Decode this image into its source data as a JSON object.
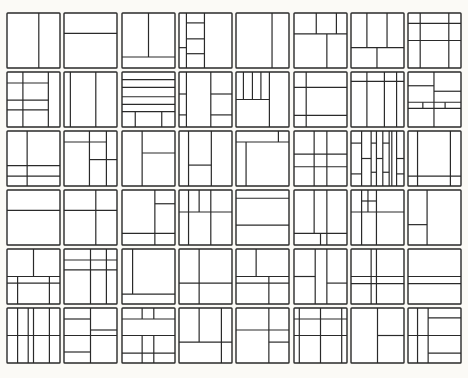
{
  "diagram": {
    "rows": 6,
    "cols": 8,
    "stroke_color": "#2a2a2a",
    "background": "#fbfaf6",
    "layout": {
      "origin_x": 7,
      "origin_y": 13,
      "cell_w": 53,
      "cell_h": 55,
      "pitch_x": 57.3,
      "pitch_y": 59.0
    },
    "cells": [
      [
        [
          [
            60,
            0,
            60,
            100
          ]
        ],
        [
          [
            0,
            37,
            100,
            37
          ]
        ],
        [
          [
            50,
            0,
            50,
            80
          ],
          [
            0,
            80,
            100,
            80
          ]
        ],
        [
          [
            14,
            0,
            14,
            100
          ],
          [
            48,
            0,
            48,
            100
          ],
          [
            14,
            18,
            48,
            18
          ],
          [
            14,
            47,
            48,
            47
          ],
          [
            0,
            63,
            14,
            63
          ],
          [
            14,
            74,
            48,
            74
          ]
        ],
        [
          [
            68,
            0,
            68,
            100
          ]
        ],
        [
          [
            0,
            38,
            100,
            38
          ],
          [
            42,
            0,
            42,
            38
          ],
          [
            80,
            0,
            80,
            38
          ],
          [
            62,
            38,
            62,
            100
          ]
        ],
        [
          [
            30,
            0,
            30,
            63
          ],
          [
            68,
            0,
            68,
            63
          ],
          [
            0,
            63,
            100,
            63
          ],
          [
            49,
            63,
            49,
            100
          ]
        ],
        [
          [
            23,
            0,
            23,
            100
          ],
          [
            77,
            0,
            77,
            100
          ],
          [
            0,
            19,
            100,
            19
          ],
          [
            0,
            50,
            100,
            50
          ]
        ]
      ],
      [
        [
          [
            30,
            0,
            30,
            100
          ],
          [
            78,
            0,
            78,
            100
          ],
          [
            0,
            20,
            78,
            20
          ],
          [
            0,
            51,
            78,
            51
          ],
          [
            0,
            69,
            78,
            69
          ]
        ],
        [
          [
            12,
            0,
            12,
            100
          ],
          [
            60,
            0,
            60,
            100
          ]
        ],
        [
          [
            0,
            14,
            100,
            14
          ],
          [
            0,
            28,
            100,
            28
          ],
          [
            0,
            45,
            100,
            45
          ],
          [
            0,
            59,
            100,
            59
          ],
          [
            0,
            72,
            100,
            72
          ],
          [
            25,
            72,
            25,
            100
          ],
          [
            75,
            72,
            75,
            100
          ]
        ],
        [
          [
            14,
            0,
            14,
            100
          ],
          [
            60,
            0,
            60,
            100
          ],
          [
            0,
            40,
            14,
            40
          ],
          [
            60,
            40,
            100,
            40
          ],
          [
            0,
            78,
            14,
            78
          ],
          [
            60,
            78,
            100,
            78
          ]
        ],
        [
          [
            14,
            0,
            14,
            50
          ],
          [
            31,
            0,
            31,
            50
          ],
          [
            47,
            0,
            47,
            50
          ],
          [
            63,
            0,
            63,
            100
          ],
          [
            0,
            50,
            63,
            50
          ]
        ],
        [
          [
            23,
            0,
            23,
            100
          ],
          [
            0,
            28,
            100,
            28
          ],
          [
            0,
            79,
            100,
            79
          ]
        ],
        [
          [
            0,
            17,
            100,
            17
          ],
          [
            30,
            0,
            30,
            100
          ],
          [
            63,
            0,
            63,
            100
          ],
          [
            86,
            0,
            86,
            100
          ]
        ],
        [
          [
            49,
            0,
            49,
            100
          ],
          [
            0,
            25,
            49,
            25
          ],
          [
            49,
            35,
            100,
            35
          ],
          [
            0,
            55,
            100,
            55
          ],
          [
            0,
            66,
            100,
            66
          ],
          [
            28,
            55,
            28,
            66
          ],
          [
            70,
            55,
            70,
            66
          ]
        ]
      ],
      [
        [
          [
            38,
            0,
            38,
            100
          ],
          [
            0,
            63,
            100,
            63
          ],
          [
            0,
            82,
            100,
            82
          ]
        ],
        [
          [
            0,
            20,
            80,
            20
          ],
          [
            48,
            0,
            48,
            100
          ],
          [
            80,
            0,
            80,
            100
          ],
          [
            48,
            52,
            100,
            52
          ]
        ],
        [
          [
            38,
            0,
            38,
            100
          ],
          [
            38,
            40,
            100,
            40
          ]
        ],
        [
          [
            18,
            0,
            18,
            100
          ],
          [
            61,
            0,
            61,
            100
          ],
          [
            18,
            62,
            61,
            62
          ]
        ],
        [
          [
            0,
            20,
            100,
            20
          ],
          [
            19,
            20,
            19,
            100
          ],
          [
            80,
            0,
            80,
            20
          ]
        ],
        [
          [
            38,
            0,
            38,
            100
          ],
          [
            62,
            0,
            62,
            100
          ],
          [
            0,
            42,
            100,
            42
          ],
          [
            0,
            65,
            100,
            65
          ]
        ],
        [
          [
            20,
            0,
            20,
            100
          ],
          [
            38,
            0,
            38,
            100
          ],
          [
            48,
            0,
            48,
            100
          ],
          [
            60,
            0,
            60,
            100
          ],
          [
            72,
            0,
            72,
            100
          ],
          [
            77,
            0,
            77,
            100
          ],
          [
            86,
            0,
            86,
            100
          ],
          [
            0,
            22,
            20,
            22
          ],
          [
            20,
            50,
            38,
            50
          ],
          [
            38,
            22,
            48,
            22
          ],
          [
            48,
            50,
            60,
            50
          ],
          [
            60,
            22,
            72,
            22
          ],
          [
            38,
            75,
            48,
            75
          ],
          [
            60,
            75,
            72,
            75
          ],
          [
            0,
            78,
            20,
            78
          ],
          [
            86,
            50,
            100,
            50
          ],
          [
            86,
            78,
            100,
            78
          ]
        ],
        [
          [
            18,
            0,
            18,
            100
          ],
          [
            80,
            0,
            80,
            100
          ],
          [
            0,
            82,
            100,
            82
          ]
        ]
      ],
      [
        [
          [
            0,
            37,
            100,
            37
          ]
        ],
        [
          [
            60,
            0,
            60,
            100
          ],
          [
            0,
            37,
            100,
            37
          ]
        ],
        [
          [
            62,
            0,
            62,
            100
          ],
          [
            62,
            25,
            100,
            25
          ],
          [
            0,
            79,
            100,
            79
          ]
        ],
        [
          [
            18,
            0,
            18,
            100
          ],
          [
            38,
            0,
            38,
            40
          ],
          [
            60,
            0,
            60,
            100
          ],
          [
            0,
            40,
            100,
            40
          ]
        ],
        [
          [
            0,
            15,
            100,
            15
          ],
          [
            0,
            64,
            100,
            64
          ]
        ],
        [
          [
            38,
            0,
            38,
            79
          ],
          [
            62,
            0,
            62,
            100
          ],
          [
            0,
            79,
            100,
            79
          ],
          [
            50,
            79,
            50,
            100
          ]
        ],
        [
          [
            20,
            0,
            20,
            100
          ],
          [
            32,
            0,
            32,
            40
          ],
          [
            48,
            0,
            48,
            100
          ],
          [
            20,
            20,
            48,
            20
          ],
          [
            0,
            40,
            100,
            40
          ]
        ],
        [
          [
            36,
            0,
            36,
            100
          ],
          [
            0,
            63,
            36,
            63
          ]
        ]
      ],
      [
        [
          [
            50,
            0,
            50,
            50
          ],
          [
            20,
            50,
            20,
            100
          ],
          [
            80,
            50,
            80,
            100
          ],
          [
            0,
            50,
            100,
            50
          ],
          [
            0,
            62,
            100,
            62
          ]
        ],
        [
          [
            50,
            0,
            50,
            100
          ],
          [
            80,
            0,
            80,
            100
          ],
          [
            0,
            20,
            100,
            20
          ],
          [
            0,
            38,
            100,
            38
          ]
        ],
        [
          [
            20,
            0,
            20,
            82
          ],
          [
            0,
            82,
            100,
            82
          ]
        ],
        [
          [
            38,
            0,
            38,
            100
          ],
          [
            0,
            62,
            100,
            62
          ]
        ],
        [
          [
            38,
            0,
            38,
            50
          ],
          [
            62,
            50,
            62,
            100
          ],
          [
            0,
            50,
            100,
            50
          ],
          [
            0,
            62,
            100,
            62
          ]
        ],
        [
          [
            40,
            0,
            40,
            100
          ],
          [
            62,
            0,
            62,
            100
          ],
          [
            0,
            50,
            40,
            50
          ],
          [
            62,
            62,
            100,
            62
          ]
        ],
        [
          [
            38,
            0,
            38,
            100
          ],
          [
            48,
            0,
            48,
            100
          ],
          [
            0,
            50,
            100,
            50
          ],
          [
            0,
            63,
            100,
            63
          ]
        ],
        [
          [
            0,
            50,
            100,
            50
          ],
          [
            0,
            63,
            100,
            63
          ]
        ]
      ],
      [
        [
          [
            20,
            0,
            20,
            100
          ],
          [
            40,
            0,
            40,
            100
          ],
          [
            50,
            0,
            50,
            100
          ],
          [
            80,
            0,
            80,
            100
          ],
          [
            0,
            50,
            100,
            50
          ]
        ],
        [
          [
            50,
            0,
            50,
            100
          ],
          [
            0,
            20,
            50,
            20
          ],
          [
            50,
            40,
            100,
            40
          ],
          [
            0,
            50,
            100,
            50
          ],
          [
            0,
            80,
            50,
            80
          ]
        ],
        [
          [
            38,
            0,
            38,
            20
          ],
          [
            60,
            0,
            60,
            20
          ],
          [
            0,
            20,
            100,
            20
          ],
          [
            0,
            50,
            100,
            50
          ],
          [
            38,
            50,
            38,
            100
          ],
          [
            60,
            50,
            60,
            100
          ],
          [
            0,
            82,
            100,
            82
          ]
        ],
        [
          [
            38,
            0,
            38,
            62
          ],
          [
            80,
            0,
            80,
            100
          ],
          [
            0,
            62,
            100,
            62
          ]
        ],
        [
          [
            62,
            0,
            62,
            100
          ],
          [
            0,
            40,
            100,
            40
          ],
          [
            62,
            62,
            100,
            62
          ]
        ],
        [
          [
            10,
            0,
            10,
            100
          ],
          [
            50,
            0,
            50,
            100
          ],
          [
            90,
            0,
            90,
            100
          ],
          [
            0,
            20,
            100,
            20
          ],
          [
            0,
            50,
            100,
            50
          ]
        ],
        [
          [
            50,
            0,
            50,
            100
          ],
          [
            50,
            50,
            100,
            50
          ]
        ],
        [
          [
            18,
            0,
            18,
            100
          ],
          [
            38,
            0,
            38,
            100
          ],
          [
            38,
            18,
            100,
            18
          ],
          [
            0,
            50,
            100,
            50
          ],
          [
            38,
            82,
            100,
            82
          ]
        ]
      ]
    ]
  }
}
